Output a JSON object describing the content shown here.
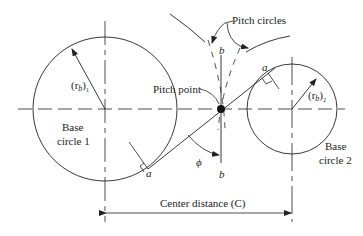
{
  "labels": {
    "pitch_circles": "Pitch circles",
    "pitch_point": "Pitch point",
    "radius_1_main": "(r",
    "radius_1_sub": "b",
    "radius_1_close": ")",
    "radius_1_index": "1",
    "radius_2_main": "(r",
    "radius_2_sub": "b",
    "radius_2_close": ")",
    "radius_2_index": "2",
    "base_circle_1_line1": "Base",
    "base_circle_1_line2": "circle 1",
    "base_circle_2_line1": "Base",
    "base_circle_2_line2": "circle 2",
    "tangent_point_a_1": "a",
    "tangent_point_a_2": "a",
    "line_b_top": "b",
    "line_b_bottom": "b",
    "pressure_angle": "ϕ",
    "center_distance": "Center distance (C)"
  },
  "colors": {
    "stroke": "#222222",
    "background": "#ffffff"
  }
}
